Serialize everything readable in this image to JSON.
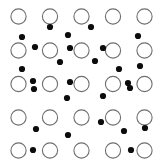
{
  "figure": {
    "canvas": {
      "width": 164,
      "height": 167
    },
    "background_color": "#ffffff",
    "circle": {
      "label": "open circle",
      "radius": 7.6,
      "stroke_color": "#6e6e6e",
      "stroke_width": 1.1,
      "fill_color": "#ffffff",
      "count": 25
    },
    "dot": {
      "label": "filled dot",
      "radius": 3.1,
      "fill_color": "#0c0c0c",
      "count": 24
    }
  },
  "chart_data": {
    "type": "scatter",
    "xlabel": "",
    "ylabel": "",
    "xlim": [
      0,
      164
    ],
    "ylim": [
      0,
      167
    ],
    "grid": false,
    "legend": "none",
    "series": [
      {
        "name": "open circles",
        "marker": "open-circle",
        "color": "#6e6e6e",
        "size": 15.2,
        "points": [
          [
            18.5,
            16.5
          ],
          [
            50.0,
            16.5
          ],
          [
            81.5,
            16.5
          ],
          [
            113.0,
            16.5
          ],
          [
            144.5,
            16.5
          ],
          [
            18.5,
            50.5
          ],
          [
            50.0,
            50.5
          ],
          [
            81.5,
            50.5
          ],
          [
            113.0,
            50.5
          ],
          [
            144.5,
            50.5
          ],
          [
            18.5,
            84.0
          ],
          [
            50.0,
            84.0
          ],
          [
            81.5,
            84.0
          ],
          [
            113.0,
            84.0
          ],
          [
            144.5,
            84.0
          ],
          [
            18.5,
            117.5
          ],
          [
            50.0,
            117.5
          ],
          [
            81.5,
            117.5
          ],
          [
            113.0,
            117.5
          ],
          [
            144.5,
            117.5
          ],
          [
            18.5,
            150.5
          ],
          [
            50.0,
            150.5
          ],
          [
            81.5,
            150.5
          ],
          [
            113.0,
            150.5
          ],
          [
            144.5,
            150.5
          ]
        ]
      },
      {
        "name": "filled dots",
        "marker": "filled-circle",
        "color": "#0c0c0c",
        "size": 6.2,
        "points": [
          [
            50.0,
            27.0
          ],
          [
            91.0,
            27.0
          ],
          [
            68.0,
            35.0
          ],
          [
            22.0,
            37.0
          ],
          [
            138.0,
            36.0
          ],
          [
            35.0,
            47.0
          ],
          [
            70.0,
            48.0
          ],
          [
            103.0,
            48.0
          ],
          [
            60.0,
            62.0
          ],
          [
            95.0,
            61.0
          ],
          [
            22.0,
            69.0
          ],
          [
            119.0,
            69.0
          ],
          [
            140.0,
            66.0
          ],
          [
            33.0,
            81.0
          ],
          [
            70.0,
            82.0
          ],
          [
            128.0,
            83.0
          ],
          [
            34.0,
            89.0
          ],
          [
            130.0,
            88.0
          ],
          [
            67.0,
            98.0
          ],
          [
            103.0,
            96.0
          ],
          [
            101.0,
            122.0
          ],
          [
            36.0,
            129.0
          ],
          [
            124.0,
            131.0
          ],
          [
            145.0,
            128.0
          ],
          [
            68.0,
            135.0
          ],
          [
            33.0,
            150.0
          ],
          [
            131.0,
            150.0
          ]
        ]
      }
    ]
  }
}
